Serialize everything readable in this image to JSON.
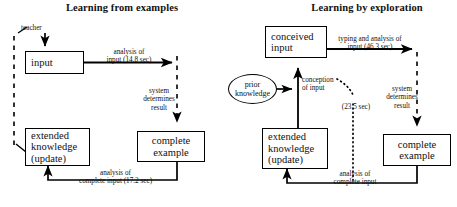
{
  "diagram": {
    "type": "flow-diagram",
    "panels": [
      {
        "id": "learning-from-examples",
        "title": "Learning from examples",
        "nodes": [
          {
            "id": "input",
            "label": "input",
            "shape": "rectangle"
          },
          {
            "id": "extended-knowledge-left",
            "label": "extended\nknowledge\n(update)",
            "shape": "rectangle"
          },
          {
            "id": "complete-example-left",
            "label": "complete\nexample",
            "shape": "rectangle"
          }
        ],
        "annotations": [
          {
            "id": "teacher",
            "label": "teacher"
          }
        ],
        "edges": [
          {
            "id": "analysis-of-input",
            "label": "analysis of\ninput (14.8 sec)",
            "style": "solid"
          },
          {
            "id": "system-determines-result-left",
            "label": "system\ndetermines\nresult",
            "style": "dashed"
          },
          {
            "id": "analysis-of-complete-input-left",
            "label": "analysis of\ncomplete input (17.2 sec)",
            "style": "solid"
          }
        ]
      },
      {
        "id": "learning-by-exploration",
        "title": "Learning by exploration",
        "nodes": [
          {
            "id": "conceived-input",
            "label": "conceived\ninput",
            "shape": "rectangle"
          },
          {
            "id": "prior-knowledge",
            "label": "prior\nknowledge",
            "shape": "ellipse"
          },
          {
            "id": "extended-knowledge-right",
            "label": "extended\nknowledge\n(update)",
            "shape": "rectangle"
          },
          {
            "id": "complete-example-right",
            "label": "complete\nexample",
            "shape": "rectangle"
          }
        ],
        "edges": [
          {
            "id": "typing-and-analysis",
            "label": "typing and analysis of\ninput (46.3 sec)",
            "style": "solid"
          },
          {
            "id": "conception-of-input",
            "label": "conception\nof input",
            "style": "solid"
          },
          {
            "id": "elapsed-time",
            "label": "(23.5 sec)",
            "style": "dotted"
          },
          {
            "id": "system-determines-result-right",
            "label": "system\ndetermines\nresult",
            "style": "dashed"
          },
          {
            "id": "analysis-of-complete-input-right",
            "label": "analysis of\ncomplete input",
            "style": "solid"
          }
        ]
      }
    ],
    "colors": {
      "stroke": "#000000",
      "background": "#ffffff",
      "text": "#111111"
    }
  }
}
